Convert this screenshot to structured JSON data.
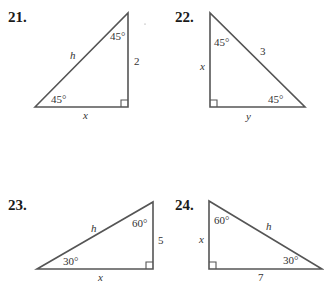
{
  "problems": [
    {
      "number": "21.",
      "type": "45-45-90 right triangle",
      "angles": {
        "top": "45°",
        "bottom_left": "45°"
      },
      "sides": {
        "hypotenuse": "h",
        "vertical_leg": "2",
        "horizontal_leg": "x"
      }
    },
    {
      "number": "22.",
      "type": "45-45-90 right triangle",
      "angles": {
        "top": "45°",
        "bottom_right": "45°"
      },
      "sides": {
        "hypotenuse": "3",
        "vertical_leg": "x",
        "horizontal_leg": "y"
      }
    },
    {
      "number": "23.",
      "type": "30-60-90 right triangle",
      "angles": {
        "top": "60°",
        "bottom_left": "30°"
      },
      "sides": {
        "hypotenuse": "h",
        "vertical_leg": "5",
        "horizontal_leg": "x"
      }
    },
    {
      "number": "24.",
      "type": "30-60-90 right triangle",
      "angles": {
        "top": "60°",
        "bottom_right": "30°"
      },
      "sides": {
        "hypotenuse": "h",
        "vertical_leg": "x",
        "horizontal_leg": "7"
      }
    }
  ],
  "colors": {
    "line": "#555555",
    "text": "#333333",
    "background": "#ffffff"
  }
}
